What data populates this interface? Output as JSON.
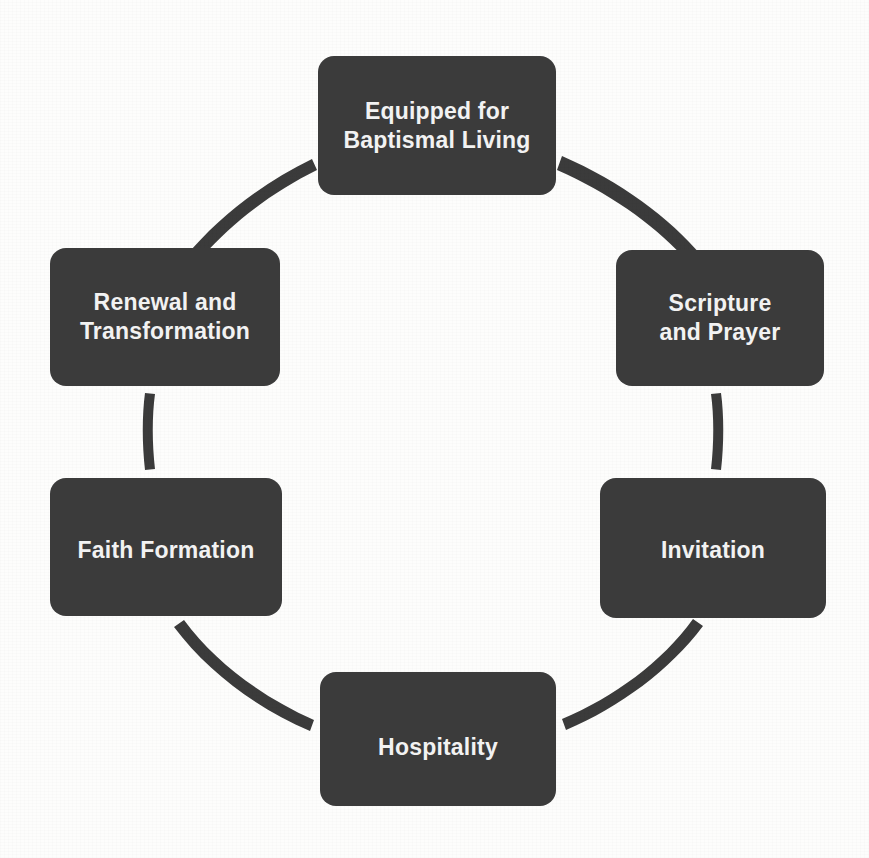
{
  "diagram": {
    "type": "cycle",
    "title": "",
    "shape": "circular-cycle-six-nodes",
    "colors": {
      "node_fill": "#3b3b3b",
      "node_text": "#f2f2f2",
      "connector": "#3b3b3b",
      "background": "#fdfdfc"
    },
    "nodes": [
      {
        "id": "equipped-for-baptismal-living",
        "label": "Equipped for\nBaptismal Living",
        "position": "top"
      },
      {
        "id": "scripture-and-prayer",
        "label": "Scripture\nand Prayer",
        "position": "upper-right"
      },
      {
        "id": "invitation",
        "label": "Invitation",
        "position": "lower-right"
      },
      {
        "id": "hospitality",
        "label": "Hospitality",
        "position": "bottom"
      },
      {
        "id": "faith-formation",
        "label": "Faith Formation",
        "position": "lower-left"
      },
      {
        "id": "renewal-and-transformation",
        "label": "Renewal and\nTransformation",
        "position": "upper-left"
      }
    ],
    "connectors": [
      {
        "id": "connector-top-to-upper-right",
        "from": "equipped-for-baptismal-living",
        "to": "scripture-and-prayer",
        "style": "tapered-arc"
      },
      {
        "id": "connector-upper-right-to-lower-right",
        "from": "scripture-and-prayer",
        "to": "invitation",
        "style": "tapered-arc"
      },
      {
        "id": "connector-lower-right-to-bottom",
        "from": "invitation",
        "to": "hospitality",
        "style": "tapered-arc"
      },
      {
        "id": "connector-bottom-to-lower-left",
        "from": "hospitality",
        "to": "faith-formation",
        "style": "tapered-arc"
      },
      {
        "id": "connector-lower-left-to-upper-left",
        "from": "faith-formation",
        "to": "renewal-and-transformation",
        "style": "tapered-arc"
      },
      {
        "id": "connector-upper-left-to-top",
        "from": "renewal-and-transformation",
        "to": "equipped-for-baptismal-living",
        "style": "tapered-arc"
      }
    ]
  }
}
